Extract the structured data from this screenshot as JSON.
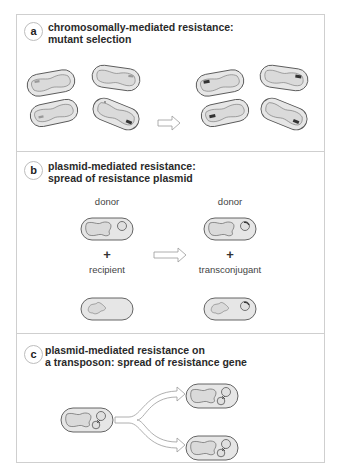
{
  "figure": {
    "colors": {
      "frame_border": "#cfcfcf",
      "cell_outline": "#555555",
      "cell_fill": "#e4e4e4",
      "cell_inner_fill": "#d9d9d9",
      "gene_mark": "#444444",
      "arrow_outline": "#9a9a9a"
    }
  },
  "panels": [
    {
      "id": "a",
      "badge": "a",
      "title_line1": "chromosomally-mediated resistance:",
      "title_line2": "mutant selection",
      "before_cells": 4,
      "after_cells": 4,
      "note": "one cell before carries a dark mutant gene mark; after selection all four carry it"
    },
    {
      "id": "b",
      "badge": "b",
      "title_line1": "plasmid-mediated resistance:",
      "title_line2": "spread of resistance plasmid",
      "labels": {
        "donor_left": "donor",
        "plus_left": "+",
        "recipient": "recipient",
        "donor_right": "donor",
        "plus_right": "+",
        "transconjugant": "transconjugant"
      }
    },
    {
      "id": "c",
      "badge": "c",
      "title_line1": "plasmid-mediated resistance on",
      "title_line2": "a transposon: spread of resistance gene"
    }
  ]
}
